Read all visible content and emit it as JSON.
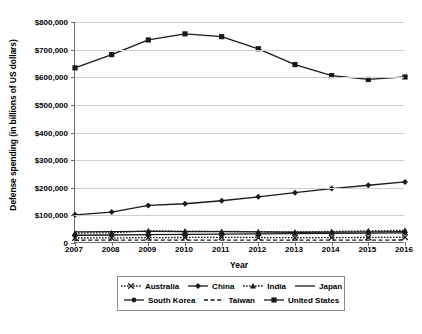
{
  "chart_data": {
    "type": "line",
    "title": "",
    "xlabel": "Year",
    "ylabel": "Defense spending (in billions of US dollars)",
    "x": [
      2007,
      2008,
      2009,
      2010,
      2011,
      2012,
      2013,
      2014,
      2015,
      2016
    ],
    "categories": [
      "2007",
      "2008",
      "2009",
      "2010",
      "2011",
      "2012",
      "2013",
      "2014",
      "2015",
      "2016"
    ],
    "ylim": [
      0,
      800000
    ],
    "ytick_values": [
      800000,
      700000,
      600000,
      500000,
      400000,
      300000,
      200000,
      100000,
      0
    ],
    "ytick_labels": [
      "$800,000",
      "$700,000",
      "$600,000",
      "$500,000",
      "$400,000",
      "$300,000",
      "$200,000",
      "$100,000",
      "0"
    ],
    "grid": "horizontal",
    "legend_position": "bottom",
    "series": [
      {
        "name": "Australia",
        "key_style": "dotted-x",
        "color": "#1a1a1a",
        "values": [
          18000,
          18500,
          19500,
          20000,
          20500,
          20000,
          19000,
          19500,
          20000,
          21000
        ]
      },
      {
        "name": "China",
        "key_style": "solid-diamond",
        "color": "#1a1a1a",
        "values": [
          102000,
          112000,
          136000,
          142000,
          153000,
          167000,
          182000,
          197000,
          209000,
          221000
        ]
      },
      {
        "name": "India",
        "key_style": "dotted-triangle",
        "color": "#1a1a1a",
        "values": [
          36000,
          37000,
          44000,
          43000,
          42000,
          41000,
          40000,
          42000,
          44000,
          46000
        ]
      },
      {
        "name": "Japan",
        "key_style": "solid-line",
        "color": "#1a1a1a",
        "values": [
          40000,
          41000,
          42000,
          41500,
          41000,
          40000,
          39000,
          39500,
          40000,
          41000
        ]
      },
      {
        "name": "South Korea",
        "key_style": "solid-circle",
        "color": "#1a1a1a",
        "values": [
          28000,
          29000,
          30000,
          31000,
          32000,
          33000,
          34000,
          35000,
          36000,
          37000
        ]
      },
      {
        "name": "Taiwan",
        "key_style": "dashed",
        "color": "#1a1a1a",
        "values": [
          10000,
          10200,
          10500,
          10300,
          10200,
          10400,
          10500,
          10600,
          10700,
          10800
        ]
      },
      {
        "name": "United States",
        "key_style": "solid-square",
        "color": "#1a1a1a",
        "values": [
          634000,
          682000,
          735000,
          757000,
          747000,
          703000,
          646000,
          606000,
          592000,
          601000
        ]
      }
    ]
  },
  "legend": {
    "rows": [
      [
        "Australia",
        "China",
        "India",
        "Japan"
      ],
      [
        "South Korea",
        "Taiwan",
        "United States"
      ]
    ]
  },
  "colors": {
    "ink": "#1a1a1a",
    "axis": "#6d6d6d",
    "grid": "#d0d0d0",
    "background": "#ffffff"
  }
}
